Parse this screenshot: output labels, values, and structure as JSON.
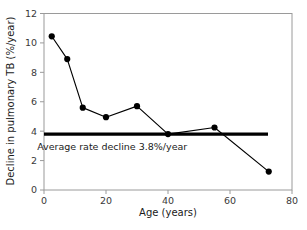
{
  "chart_data": {
    "type": "line",
    "title": "",
    "xlabel": "Age (years)",
    "ylabel": "Decline in pulmonary TB (%/year)",
    "xlim": [
      0,
      80
    ],
    "ylim": [
      0,
      12
    ],
    "xticks": [
      "0",
      "20",
      "40",
      "60",
      "80"
    ],
    "xtick_values": [
      0,
      20,
      40,
      60,
      80
    ],
    "yticks": [
      "0",
      "2",
      "4",
      "6",
      "8",
      "10",
      "12"
    ],
    "ytick_values": [
      0,
      2,
      4,
      6,
      8,
      10,
      12
    ],
    "grid": false,
    "legend": "none",
    "series": [
      {
        "name": "Decline in pulmonary TB",
        "x": [
          2.5,
          7.5,
          12.5,
          20,
          30,
          40,
          55,
          72.5
        ],
        "values": [
          10.45,
          8.9,
          5.6,
          4.95,
          5.7,
          3.8,
          4.25,
          1.25
        ],
        "marker": "filled-circle",
        "color": "#000000"
      }
    ],
    "reference_line": {
      "name": "Average rate decline",
      "value": 3.8,
      "orientation": "horizontal",
      "color": "#000000"
    },
    "annotations": [
      {
        "text": "Average rate decline 3.8%/year",
        "x": 22,
        "y": 2.75
      }
    ],
    "colors": {
      "line": "#000000",
      "marker": "#000000",
      "reference_line": "#000000",
      "frame": "#9a9a9a",
      "text": "#1a1a1a",
      "tick_text": "#3a3a3a",
      "background": "#ffffff"
    }
  }
}
